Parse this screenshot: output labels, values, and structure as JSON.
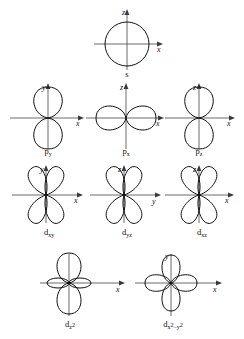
{
  "figure": {
    "background_color": "#ffffff",
    "line_color": "#111111",
    "axis_color": "#5a5a5a"
  },
  "orbitals": [
    {
      "id": "s",
      "label_main": "s",
      "label_sub": "",
      "label_sup": "",
      "shape": "sphere",
      "vertical_axis": "z",
      "horizontal_axis": "x",
      "lobe_count": 1,
      "row": 1,
      "column": 2
    },
    {
      "id": "p-y",
      "label_main": "p",
      "label_sub": "y",
      "label_sup": "",
      "shape": "dumbbell-vertical",
      "vertical_axis": "y",
      "horizontal_axis": "x",
      "lobe_count": 2,
      "row": 2,
      "column": 1
    },
    {
      "id": "p-x",
      "label_main": "p",
      "label_sub": "x",
      "label_sup": "",
      "shape": "dumbbell-horizontal",
      "vertical_axis": "z",
      "horizontal_axis": "x",
      "lobe_count": 2,
      "row": 2,
      "column": 2
    },
    {
      "id": "p-z",
      "label_main": "p",
      "label_sub": "z",
      "label_sup": "",
      "shape": "dumbbell-vertical",
      "vertical_axis": "z",
      "horizontal_axis": "x",
      "lobe_count": 2,
      "row": 2,
      "column": 3
    },
    {
      "id": "d-xy",
      "label_main": "d",
      "label_sub": "xy",
      "label_sup": "",
      "shape": "cloverleaf-diagonal",
      "vertical_axis": "y",
      "horizontal_axis": "x",
      "lobe_count": 4,
      "row": 3,
      "column": 1
    },
    {
      "id": "d-yz",
      "label_main": "d",
      "label_sub": "yz",
      "label_sup": "",
      "shape": "cloverleaf-diagonal",
      "vertical_axis": "z",
      "horizontal_axis": "y",
      "lobe_count": 4,
      "row": 3,
      "column": 2
    },
    {
      "id": "d-xz",
      "label_main": "d",
      "label_sub": "xz",
      "label_sup": "",
      "shape": "cloverleaf-diagonal",
      "vertical_axis": "z",
      "horizontal_axis": "x",
      "lobe_count": 4,
      "row": 3,
      "column": 3
    },
    {
      "id": "d-z2",
      "label_main": "d",
      "label_sub": "z",
      "label_sup": "2",
      "label_full": "dz2",
      "shape": "dumbbell-with-torus",
      "vertical_axis": "z",
      "horizontal_axis": "x",
      "lobe_count": 2,
      "row": 4,
      "column": 1
    },
    {
      "id": "d-x2-y2",
      "label_main": "d",
      "label_sub": "x",
      "label_sup": "2",
      "label_sub2": "y",
      "label_sup2": "2",
      "label_full": "dx2-y2",
      "shape": "cloverleaf-axial",
      "vertical_axis": "y",
      "horizontal_axis": "x",
      "lobe_count": 4,
      "row": 4,
      "column": 2
    }
  ],
  "axis_labels": {
    "x": "x",
    "y": "y",
    "z": "z"
  },
  "label_text": {
    "s": "s",
    "p_y": "p",
    "p_y_sub": "y",
    "p_x": "p",
    "p_x_sub": "x",
    "p_z": "p",
    "p_z_sub": "z",
    "d_xy": "d",
    "d_xy_sub": "xy",
    "d_yz": "d",
    "d_yz_sub": "yz",
    "d_xz": "d",
    "d_xz_sub": "xz",
    "d_z2": "d",
    "d_z2_sub": "z",
    "d_z2_sup": "2",
    "d_x2y2": "d",
    "d_x2y2_sub_a": "x",
    "d_x2y2_sup_a": "2",
    "d_x2y2_dash": "−",
    "d_x2y2_sub_b": "y",
    "d_x2y2_sup_b": "2"
  }
}
